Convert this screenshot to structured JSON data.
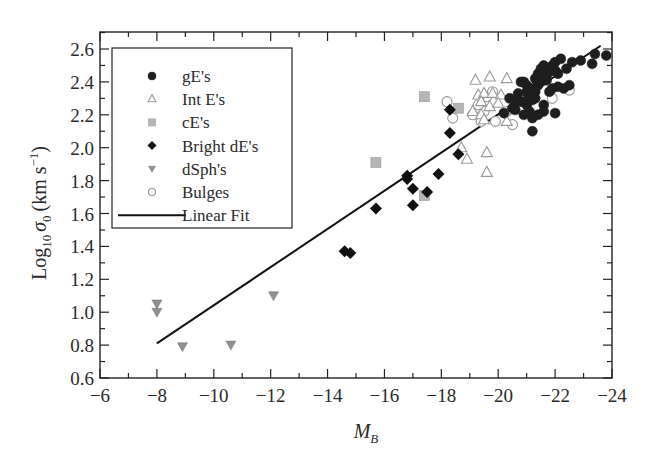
{
  "chart_data": {
    "type": "scatter",
    "title": "",
    "xlabel": "M_B",
    "ylabel": "Log10 σ0 (km s^-1)",
    "xlim": [
      -6,
      -24
    ],
    "ylim": [
      0.6,
      2.7
    ],
    "x_inverted": true,
    "x_ticks": [
      -6,
      -8,
      -10,
      -12,
      -14,
      -16,
      -18,
      -20,
      -22,
      -24
    ],
    "x_tick_labels": [
      "−6",
      "−8",
      "−10",
      "−12",
      "−14",
      "−16",
      "−18",
      "−20",
      "−22",
      "−24"
    ],
    "y_ticks": [
      0.6,
      0.8,
      1.0,
      1.2,
      1.4,
      1.6,
      1.8,
      2.0,
      2.2,
      2.4,
      2.6
    ],
    "y_tick_labels": [
      "0.6",
      "0.8",
      "1.0",
      "1.2",
      "1.4",
      "1.6",
      "1.8",
      "2.0",
      "2.2",
      "2.4",
      "2.6"
    ],
    "grid": false,
    "legend_position": "upper left",
    "series": [
      {
        "name": "gE's",
        "marker": "filled-circle",
        "color": "#1e1e1e",
        "points": [
          [
            -20.4,
            2.3
          ],
          [
            -20.6,
            2.28
          ],
          [
            -20.7,
            2.33
          ],
          [
            -20.8,
            2.4
          ],
          [
            -20.9,
            2.4
          ],
          [
            -21.0,
            2.38
          ],
          [
            -21.0,
            2.34
          ],
          [
            -21.1,
            2.31
          ],
          [
            -21.2,
            2.29
          ],
          [
            -21.3,
            2.36
          ],
          [
            -21.3,
            2.42
          ],
          [
            -21.4,
            2.45
          ],
          [
            -21.5,
            2.48
          ],
          [
            -21.6,
            2.5
          ],
          [
            -21.7,
            2.44
          ],
          [
            -21.8,
            2.46
          ],
          [
            -21.9,
            2.5
          ],
          [
            -22.0,
            2.52
          ],
          [
            -22.0,
            2.47
          ],
          [
            -22.1,
            2.45
          ],
          [
            -22.2,
            2.54
          ],
          [
            -22.4,
            2.48
          ],
          [
            -22.6,
            2.52
          ],
          [
            -22.9,
            2.53
          ],
          [
            -23.3,
            2.51
          ],
          [
            -23.4,
            2.57
          ],
          [
            -23.8,
            2.56
          ],
          [
            -21.6,
            2.44
          ],
          [
            -21.7,
            2.41
          ],
          [
            -21.5,
            2.4
          ],
          [
            -21.4,
            2.38
          ],
          [
            -21.3,
            2.34
          ],
          [
            -21.2,
            2.36
          ],
          [
            -21.0,
            2.26
          ],
          [
            -20.9,
            2.2
          ],
          [
            -21.1,
            2.22
          ],
          [
            -21.2,
            2.18
          ],
          [
            -21.3,
            2.3
          ],
          [
            -20.5,
            2.24
          ],
          [
            -20.2,
            2.21
          ],
          [
            -21.8,
            2.34
          ],
          [
            -22.3,
            2.36
          ],
          [
            -22.1,
            2.37
          ],
          [
            -21.6,
            2.26
          ],
          [
            -21.4,
            2.2
          ],
          [
            -21.6,
            2.22
          ],
          [
            -22.0,
            2.21
          ],
          [
            -21.2,
            2.1
          ],
          [
            -20.6,
            2.23
          ],
          [
            -20.8,
            2.28
          ],
          [
            -22.5,
            2.38
          ],
          [
            -21.9,
            2.36
          ]
        ]
      },
      {
        "name": "Int E's",
        "marker": "open-triangle",
        "color": "#9a9a9a",
        "points": [
          [
            -19.2,
            2.41
          ],
          [
            -19.7,
            2.43
          ],
          [
            -20.3,
            2.42
          ],
          [
            -19.3,
            2.32
          ],
          [
            -19.5,
            2.33
          ],
          [
            -19.8,
            2.33
          ],
          [
            -20.1,
            2.32
          ],
          [
            -19.4,
            2.28
          ],
          [
            -19.7,
            2.25
          ],
          [
            -19.1,
            2.22
          ],
          [
            -19.4,
            2.2
          ],
          [
            -20.0,
            2.27
          ],
          [
            -20.4,
            2.23
          ],
          [
            -18.7,
            2.0
          ],
          [
            -19.6,
            1.97
          ],
          [
            -18.9,
            1.93
          ],
          [
            -19.6,
            1.85
          ],
          [
            -20.3,
            2.16
          ],
          [
            -19.5,
            2.17
          ]
        ]
      },
      {
        "name": "cE's",
        "marker": "filled-square",
        "color": "#b5b5b5",
        "points": [
          [
            -15.7,
            1.91
          ],
          [
            -17.4,
            2.31
          ],
          [
            -17.4,
            1.71
          ],
          [
            -18.6,
            2.24
          ]
        ]
      },
      {
        "name": "Bright dE's",
        "marker": "filled-diamond",
        "color": "#111111",
        "points": [
          [
            -14.6,
            1.37
          ],
          [
            -14.8,
            1.36
          ],
          [
            -15.7,
            1.63
          ],
          [
            -16.8,
            1.83
          ],
          [
            -16.8,
            1.81
          ],
          [
            -17.0,
            1.65
          ],
          [
            -17.0,
            1.75
          ],
          [
            -17.5,
            1.73
          ],
          [
            -17.9,
            1.84
          ],
          [
            -18.3,
            2.09
          ],
          [
            -18.6,
            1.96
          ],
          [
            -18.3,
            2.23
          ]
        ]
      },
      {
        "name": "dSph's",
        "marker": "filled-down-triangle",
        "color": "#8f8f8f",
        "points": [
          [
            -8.0,
            1.05
          ],
          [
            -8.0,
            1.0
          ],
          [
            -8.9,
            0.79
          ],
          [
            -10.6,
            0.8
          ],
          [
            -12.1,
            1.1
          ]
        ]
      },
      {
        "name": "Bulges",
        "marker": "open-circle",
        "color": "#9a9a9a",
        "points": [
          [
            -18.2,
            2.28
          ],
          [
            -18.4,
            2.18
          ],
          [
            -19.1,
            2.2
          ],
          [
            -19.4,
            2.16
          ],
          [
            -19.5,
            2.22
          ],
          [
            -19.6,
            2.31
          ],
          [
            -19.8,
            2.34
          ],
          [
            -19.9,
            2.16
          ],
          [
            -20.3,
            2.22
          ],
          [
            -20.5,
            2.14
          ],
          [
            -20.7,
            2.32
          ],
          [
            -21.1,
            2.21
          ],
          [
            -21.9,
            2.3
          ],
          [
            -22.5,
            2.35
          ],
          [
            -19.3,
            2.26
          ]
        ]
      },
      {
        "name": "Linear Fit",
        "marker": "line",
        "color": "#111111",
        "points": [
          [
            -8.0,
            0.81
          ],
          [
            -23.6,
            2.62
          ]
        ]
      }
    ]
  },
  "legend": {
    "items": [
      {
        "label": "gE's",
        "symbol": "filled-circle"
      },
      {
        "label": "Int E's",
        "symbol": "open-triangle"
      },
      {
        "label": "cE's",
        "symbol": "filled-square"
      },
      {
        "label": "Bright dE's",
        "symbol": "filled-diamond"
      },
      {
        "label": "dSph's",
        "symbol": "filled-down-triangle"
      },
      {
        "label": "Bulges",
        "symbol": "open-circle"
      },
      {
        "label": "Linear Fit",
        "symbol": "line"
      }
    ]
  },
  "axes": {
    "xlabel_main": "M",
    "xlabel_sub": "B",
    "ylabel_parts": {
      "log": "Log",
      "log_sub": "10",
      "sigma": "σ",
      "sigma_sub": "0",
      "units": "(km s",
      "units_sup": "−1",
      "units_close": ")"
    }
  }
}
